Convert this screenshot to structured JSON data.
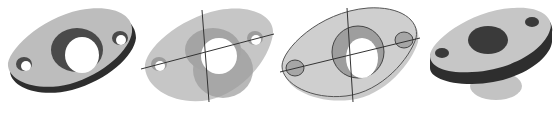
{
  "figure": {
    "background": "#ffffff",
    "panels": [
      {
        "id": "solid-shaded",
        "style": "opaque shaded solid",
        "left": 0,
        "width": 140
      },
      {
        "id": "transparent-with-axes",
        "style": "semi-transparent with centerlines",
        "left": 135,
        "width": 145
      },
      {
        "id": "outline-with-axes",
        "style": "light shaded with outlines and centerlines",
        "left": 280,
        "width": 145
      },
      {
        "id": "banded-with-boss",
        "style": "shaded with dark rim band and translucent boss",
        "left": 420,
        "width": 139
      }
    ],
    "colors": {
      "face_light": "#c8c8c8",
      "face_mid": "#a8a8a8",
      "face_dark": "#3a3a3a",
      "line": "#333333"
    }
  }
}
